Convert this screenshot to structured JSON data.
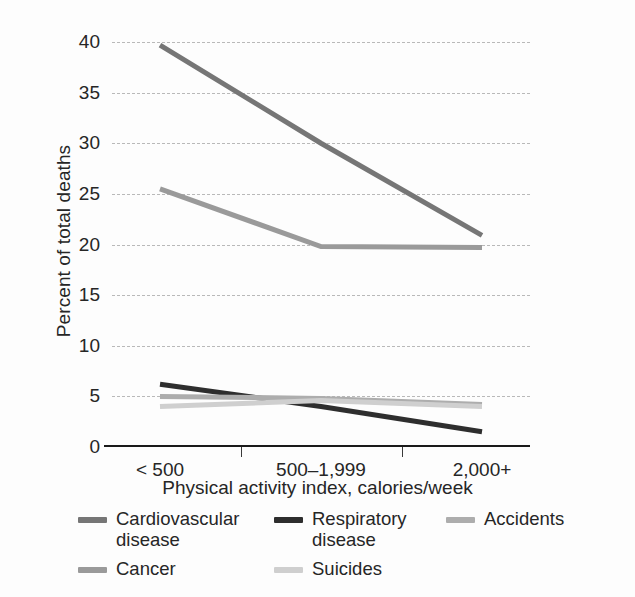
{
  "chart_data": {
    "type": "line",
    "title": "",
    "xlabel": "Physical activity index, calories/week",
    "ylabel": "Percent of total deaths",
    "categories": [
      "< 500",
      "500–1,999",
      "2,000+"
    ],
    "ylim": [
      0,
      40
    ],
    "yticks": [
      0,
      5,
      10,
      15,
      20,
      25,
      30,
      35,
      40
    ],
    "grid": "horizontal dashed gridlines at every y tick; solid black x axis at 0",
    "legend_position": "below plot, three columns, two rows",
    "series": [
      {
        "name": "Cardiovascular disease",
        "values": [
          39.7,
          30.0,
          20.9
        ],
        "color": "#767676"
      },
      {
        "name": "Respiratory disease",
        "values": [
          6.2,
          4.0,
          1.5
        ],
        "color": "#2e2e2e"
      },
      {
        "name": "Accidents",
        "values": [
          5.0,
          4.8,
          4.2
        ],
        "color": "#adadad"
      },
      {
        "name": "Cancer",
        "values": [
          25.5,
          19.8,
          19.7
        ],
        "color": "#9a9a9a"
      },
      {
        "name": "Suicides",
        "values": [
          4.0,
          4.6,
          4.0
        ],
        "color": "#cfcfcf"
      }
    ]
  },
  "axis": {
    "y_ticks": [
      "40",
      "35",
      "30",
      "25",
      "20",
      "15",
      "10",
      "5",
      "0"
    ],
    "x_ticks": [
      "< 500",
      "500–1,999",
      "2,000+"
    ],
    "y_title": "Percent of total deaths",
    "x_title": "Physical activity index, calories/week"
  },
  "legend": {
    "rows": [
      [
        {
          "label": "Cardiovascular disease",
          "color": "#767676"
        },
        {
          "label": "Respiratory disease",
          "color": "#2e2e2e"
        },
        {
          "label": "Accidents",
          "color": "#adadad"
        }
      ],
      [
        {
          "label": "Cancer",
          "color": "#9a9a9a"
        },
        {
          "label": "Suicides",
          "color": "#cfcfcf"
        }
      ]
    ]
  }
}
